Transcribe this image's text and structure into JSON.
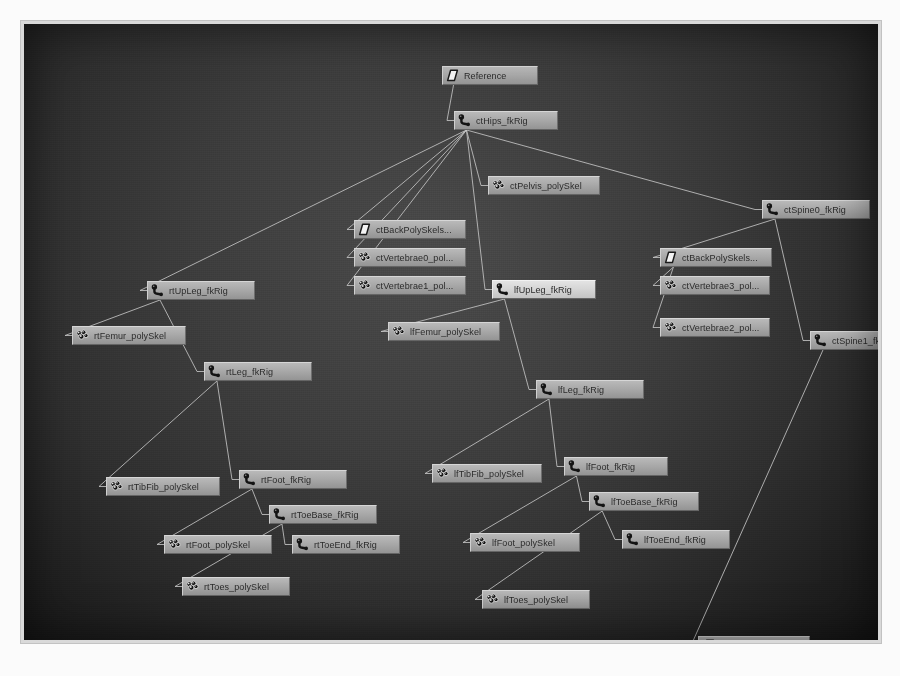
{
  "app": {
    "view": "hypergraph",
    "background_color": "#3d3d3d",
    "node_color": "#a9a9a9",
    "node_selected_color": "#d6d6d6",
    "edge_color": "#c8c8c8",
    "label_color": "#2b2b2b"
  },
  "icons": {
    "reference": "reference-plane-icon",
    "joint": "joint-icon",
    "mesh": "poly-mesh-icon"
  },
  "nodes": [
    {
      "id": "reference",
      "label": "Reference",
      "icon": "reference",
      "x": 418,
      "y": 42,
      "w": 96,
      "selected": false
    },
    {
      "id": "ctHips",
      "label": "ctHips_fkRig",
      "icon": "joint",
      "x": 430,
      "y": 87,
      "w": 104,
      "selected": false
    },
    {
      "id": "ctPelvis",
      "label": "ctPelvis_polySkel",
      "icon": "mesh",
      "x": 464,
      "y": 152,
      "w": 112,
      "selected": false
    },
    {
      "id": "ctBackPolySkel0",
      "label": "ctBackPolySkels...",
      "icon": "reference",
      "x": 330,
      "y": 196,
      "w": 112,
      "selected": false
    },
    {
      "id": "ctVertebrae0",
      "label": "ctVertebrae0_pol...",
      "icon": "mesh",
      "x": 330,
      "y": 224,
      "w": 112,
      "selected": false
    },
    {
      "id": "ctVertebrae1",
      "label": "ctVertebrae1_pol...",
      "icon": "mesh",
      "x": 330,
      "y": 252,
      "w": 112,
      "selected": false
    },
    {
      "id": "ctSpine0",
      "label": "ctSpine0_fkRig",
      "icon": "joint",
      "x": 738,
      "y": 176,
      "w": 108,
      "selected": false
    },
    {
      "id": "ctBackPolySkel1",
      "label": "ctBackPolySkels...",
      "icon": "reference",
      "x": 636,
      "y": 224,
      "w": 112,
      "selected": false
    },
    {
      "id": "ctVertebrae3",
      "label": "ctVertebrae3_pol...",
      "icon": "mesh",
      "x": 636,
      "y": 252,
      "w": 110,
      "selected": false
    },
    {
      "id": "ctVertebrae2",
      "label": "ctVertebrae2_pol...",
      "icon": "mesh",
      "x": 636,
      "y": 294,
      "w": 110,
      "selected": false
    },
    {
      "id": "ctSpine1",
      "label": "ctSpine1_fkRig",
      "icon": "joint",
      "x": 786,
      "y": 307,
      "w": 108,
      "selected": false
    },
    {
      "id": "rtUpLeg",
      "label": "rtUpLeg_fkRig",
      "icon": "joint",
      "x": 123,
      "y": 257,
      "w": 108,
      "selected": false
    },
    {
      "id": "rtFemur",
      "label": "rtFemur_polySkel",
      "icon": "mesh",
      "x": 48,
      "y": 302,
      "w": 114,
      "selected": false
    },
    {
      "id": "rtLeg",
      "label": "rtLeg_fkRig",
      "icon": "joint",
      "x": 180,
      "y": 338,
      "w": 108,
      "selected": false
    },
    {
      "id": "rtTibFib",
      "label": "rtTibFib_polySkel",
      "icon": "mesh",
      "x": 82,
      "y": 453,
      "w": 114,
      "selected": false
    },
    {
      "id": "rtFoot",
      "label": "rtFoot_fkRig",
      "icon": "joint",
      "x": 215,
      "y": 446,
      "w": 108,
      "selected": false
    },
    {
      "id": "rtToeBase",
      "label": "rtToeBase_fkRig",
      "icon": "joint",
      "x": 245,
      "y": 481,
      "w": 108,
      "selected": false
    },
    {
      "id": "rtFoot_poly",
      "label": "rtFoot_polySkel",
      "icon": "mesh",
      "x": 140,
      "y": 511,
      "w": 108,
      "selected": false
    },
    {
      "id": "rtToeEnd",
      "label": "rtToeEnd_fkRig",
      "icon": "joint",
      "x": 268,
      "y": 511,
      "w": 108,
      "selected": false
    },
    {
      "id": "rtToes_poly",
      "label": "rtToes_polySkel",
      "icon": "mesh",
      "x": 158,
      "y": 553,
      "w": 108,
      "selected": false
    },
    {
      "id": "lfUpLeg",
      "label": "lfUpLeg_fkRig",
      "icon": "joint",
      "x": 468,
      "y": 256,
      "w": 104,
      "selected": true
    },
    {
      "id": "lfFemur",
      "label": "lfFemur_polySkel",
      "icon": "mesh",
      "x": 364,
      "y": 298,
      "w": 112,
      "selected": false
    },
    {
      "id": "lfLeg",
      "label": "lfLeg_fkRig",
      "icon": "joint",
      "x": 512,
      "y": 356,
      "w": 108,
      "selected": false
    },
    {
      "id": "lfTibFib",
      "label": "lfTibFib_polySkel",
      "icon": "mesh",
      "x": 408,
      "y": 440,
      "w": 110,
      "selected": false
    },
    {
      "id": "lfFoot",
      "label": "lfFoot_fkRig",
      "icon": "joint",
      "x": 540,
      "y": 433,
      "w": 104,
      "selected": false
    },
    {
      "id": "lfToeBase",
      "label": "lfToeBase_fkRig",
      "icon": "joint",
      "x": 565,
      "y": 468,
      "w": 110,
      "selected": false
    },
    {
      "id": "lfFoot_poly",
      "label": "lfFoot_polySkel",
      "icon": "mesh",
      "x": 446,
      "y": 509,
      "w": 110,
      "selected": false
    },
    {
      "id": "lfToeEnd",
      "label": "lfToeEnd_fkRig",
      "icon": "joint",
      "x": 598,
      "y": 506,
      "w": 108,
      "selected": false
    },
    {
      "id": "lfToes_poly",
      "label": "lfToes_polySkel",
      "icon": "mesh",
      "x": 458,
      "y": 566,
      "w": 108,
      "selected": false
    },
    {
      "id": "ctBackPolySkel2",
      "label": "ctBackPolySkels...",
      "icon": "reference",
      "x": 674,
      "y": 612,
      "w": 112,
      "selected": false
    }
  ],
  "edges": [
    {
      "from": "reference",
      "to": "ctHips"
    },
    {
      "from": "ctHips",
      "to": "ctPelvis"
    },
    {
      "from": "ctHips",
      "to": "ctBackPolySkel0"
    },
    {
      "from": "ctHips",
      "to": "ctVertebrae0"
    },
    {
      "from": "ctHips",
      "to": "ctVertebrae1"
    },
    {
      "from": "ctHips",
      "to": "ctSpine0"
    },
    {
      "from": "ctHips",
      "to": "rtUpLeg"
    },
    {
      "from": "ctHips",
      "to": "lfUpLeg"
    },
    {
      "from": "ctSpine0",
      "to": "ctBackPolySkel1"
    },
    {
      "from": "ctSpine0",
      "to": "ctSpine1"
    },
    {
      "from": "ctBackPolySkel1",
      "to": "ctVertebrae3"
    },
    {
      "from": "ctBackPolySkel1",
      "to": "ctVertebrae2"
    },
    {
      "from": "ctSpine1",
      "to": "ctBackPolySkel2"
    },
    {
      "from": "rtUpLeg",
      "to": "rtFemur"
    },
    {
      "from": "rtUpLeg",
      "to": "rtLeg"
    },
    {
      "from": "rtLeg",
      "to": "rtTibFib"
    },
    {
      "from": "rtLeg",
      "to": "rtFoot"
    },
    {
      "from": "rtFoot",
      "to": "rtToeBase"
    },
    {
      "from": "rtFoot",
      "to": "rtFoot_poly"
    },
    {
      "from": "rtToeBase",
      "to": "rtToeEnd"
    },
    {
      "from": "rtToeBase",
      "to": "rtToes_poly"
    },
    {
      "from": "lfUpLeg",
      "to": "lfFemur"
    },
    {
      "from": "lfUpLeg",
      "to": "lfLeg"
    },
    {
      "from": "lfLeg",
      "to": "lfTibFib"
    },
    {
      "from": "lfLeg",
      "to": "lfFoot"
    },
    {
      "from": "lfFoot",
      "to": "lfToeBase"
    },
    {
      "from": "lfFoot",
      "to": "lfFoot_poly"
    },
    {
      "from": "lfToeBase",
      "to": "lfToeEnd"
    },
    {
      "from": "lfToeBase",
      "to": "lfToes_poly"
    }
  ]
}
